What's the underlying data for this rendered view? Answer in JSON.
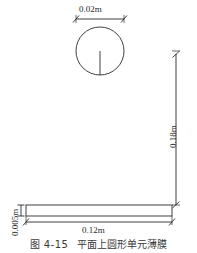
{
  "figure": {
    "caption_number": "图 4-15",
    "caption_title": "平面上圆形单元薄膜",
    "background_color": "#ffffff",
    "line_color": "#2b2b2b"
  },
  "dimensions": {
    "circle_diameter": "0.02m",
    "plate_height_offset": "0.18m",
    "plate_thickness": "0.005m",
    "plate_width": "0.12m"
  },
  "geometry": {
    "circle": {
      "center_x": 100,
      "center_y": 51,
      "radius": 24,
      "radius_line_label": "radius-line"
    },
    "plate": {
      "x": 26,
      "y": 205,
      "width": 146,
      "height": 11
    }
  }
}
